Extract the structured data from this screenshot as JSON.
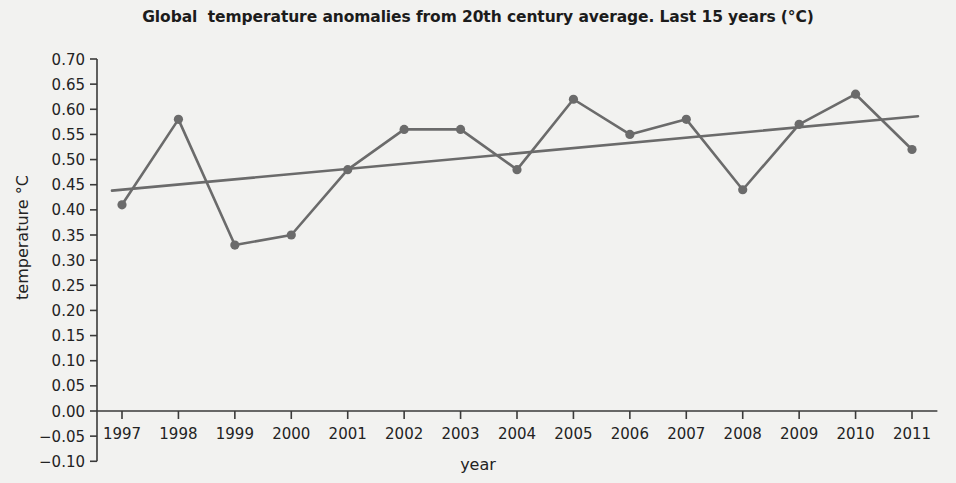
{
  "chart_data": {
    "type": "line",
    "title": "Global  temperature anomalies from 20th century average. Last 15 years (°C)",
    "xlabel": "year",
    "ylabel": "temperature °C",
    "categories": [
      "1997",
      "1998",
      "1999",
      "2000",
      "2001",
      "2002",
      "2003",
      "2004",
      "2005",
      "2006",
      "2007",
      "2008",
      "2009",
      "2010",
      "2011"
    ],
    "x": [
      1997,
      1998,
      1999,
      2000,
      2001,
      2002,
      2003,
      2004,
      2005,
      2006,
      2007,
      2008,
      2009,
      2010,
      2011
    ],
    "series": [
      {
        "name": "temperature anomaly",
        "type": "line",
        "color": "#6b6b6b",
        "marker": "circle",
        "values": [
          0.41,
          0.58,
          0.33,
          0.35,
          0.48,
          0.56,
          0.56,
          0.48,
          0.62,
          0.55,
          0.58,
          0.44,
          0.57,
          0.63,
          0.52
        ]
      },
      {
        "name": "linear trend",
        "type": "trendline",
        "color": "#6b6b6b",
        "marker": "none",
        "endpoints": [
          {
            "x": 1997,
            "y": 0.44
          },
          {
            "x": 2011,
            "y": 0.585
          }
        ]
      }
    ],
    "ylim": [
      -0.1,
      0.7
    ],
    "ytick_labels": [
      "0.70",
      "0.65",
      "0.60",
      "0.55",
      "0.50",
      "0.45",
      "0.40",
      "0.35",
      "0.30",
      "0.25",
      "0.20",
      "0.15",
      "0.10",
      "0.05",
      "0.00",
      "−0.05",
      "−0.10"
    ],
    "ytick_values": [
      0.7,
      0.65,
      0.6,
      0.55,
      0.5,
      0.45,
      0.4,
      0.35,
      0.3,
      0.25,
      0.2,
      0.15,
      0.1,
      0.05,
      0.0,
      -0.05,
      -0.1
    ],
    "xlim": [
      1996.55,
      2011.45
    ],
    "grid": false,
    "legend": "none",
    "background_color": "#f2f2f0",
    "axis_color": "#3a3a3a"
  }
}
